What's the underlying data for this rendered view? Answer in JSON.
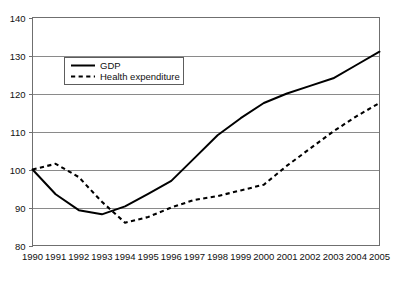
{
  "chart_data": {
    "type": "line",
    "title": "",
    "subtitle": "",
    "xlabel": "",
    "ylabel": "",
    "categories": [
      "1990",
      "1991",
      "1992",
      "1993",
      "1994",
      "1995",
      "1996",
      "1997",
      "1998",
      "1999",
      "2000",
      "2001",
      "2002",
      "2003",
      "2004",
      "2005"
    ],
    "x": [
      1990,
      1991,
      1992,
      1993,
      1994,
      1995,
      1996,
      1997,
      1998,
      1999,
      2000,
      2001,
      2002,
      2003,
      2004,
      2005
    ],
    "series": [
      {
        "name": "GDP",
        "style": "solid",
        "color": "#000000",
        "values": [
          100,
          93.5,
          89.3,
          88.2,
          90.3,
          93.6,
          97.0,
          103.0,
          109.0,
          113.5,
          117.5,
          120.0,
          122.0,
          124.0,
          127.5,
          131.0
        ]
      },
      {
        "name": "Health expenditure",
        "style": "dashed",
        "color": "#000000",
        "values": [
          100,
          101.5,
          98.0,
          91.5,
          86.0,
          87.5,
          90.0,
          92.0,
          93.0,
          94.5,
          96.0,
          101.0,
          105.5,
          110.0,
          114.0,
          117.5
        ]
      }
    ],
    "ylim": [
      80,
      140
    ],
    "xlim": [
      1990,
      2005
    ],
    "yticks": [
      80,
      90,
      100,
      110,
      120,
      130,
      140
    ],
    "ytick_labels": [
      "80",
      "90",
      "100",
      "110",
      "120",
      "130",
      "140"
    ],
    "xtick_labels": [
      "1990",
      "1991",
      "1992",
      "1993",
      "1994",
      "1995",
      "1996",
      "1997",
      "1998",
      "1999",
      "2000",
      "2001",
      "2002",
      "2003",
      "2004",
      "2005"
    ],
    "grid": "horizontal",
    "legend_position": "upper-left-inset",
    "legend_entries": [
      "GDP",
      "Health expenditure"
    ]
  },
  "legend": {
    "gdp_label": "GDP",
    "health_label": "Health expenditure"
  },
  "colors": {
    "line": "#000000",
    "grid": "#8a8a8a",
    "frame": "#6f6f6f",
    "text": "#111111",
    "background": "#ffffff"
  }
}
